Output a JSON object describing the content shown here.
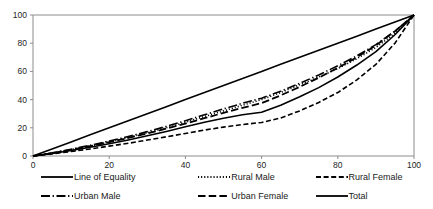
{
  "chart_data": {
    "type": "line",
    "title": "",
    "subtitle": "",
    "xlabel": "",
    "ylabel": "",
    "xlim": [
      0,
      100
    ],
    "ylim": [
      0,
      100
    ],
    "grid": false,
    "legend_position": "bottom",
    "xticks": [
      "0",
      "20",
      "40",
      "60",
      "80",
      "100"
    ],
    "yticks": [
      "0",
      "20",
      "40",
      "60",
      "80",
      "100"
    ],
    "xtick_values": [
      0,
      20,
      40,
      60,
      80,
      100
    ],
    "ytick_values": [
      0,
      20,
      40,
      60,
      80,
      100
    ],
    "x": [
      0,
      5,
      10,
      15,
      20,
      25,
      30,
      35,
      40,
      45,
      50,
      55,
      60,
      65,
      70,
      75,
      80,
      85,
      90,
      95,
      100
    ],
    "series": [
      {
        "name": "Line of Equality",
        "style": "solid",
        "color": "#000000",
        "width": 1.6,
        "values": [
          0,
          5,
          10,
          15,
          20,
          25,
          30,
          35,
          40,
          45,
          50,
          55,
          60,
          65,
          70,
          75,
          80,
          85,
          90,
          95,
          100
        ]
      },
      {
        "name": "Rural Male",
        "style": "dotted",
        "color": "#000000",
        "width": 1.6,
        "values": [
          0,
          2,
          4.5,
          7,
          10,
          13,
          16.5,
          20,
          24,
          28,
          32,
          36,
          40,
          45,
          50.5,
          56,
          62,
          69,
          77,
          87,
          100
        ]
      },
      {
        "name": "Rural Female",
        "style": "dashed",
        "color": "#000000",
        "width": 1.6,
        "values": [
          0,
          1.5,
          3.2,
          5,
          7,
          9,
          11.3,
          13.6,
          16,
          18.4,
          20.5,
          22.3,
          23.8,
          27,
          32,
          38,
          45,
          54,
          65,
          80,
          100
        ]
      },
      {
        "name": "Urban Male",
        "style": "dashdot",
        "color": "#000000",
        "width": 1.6,
        "values": [
          0,
          2.2,
          4.8,
          7.6,
          10.6,
          13.8,
          17.3,
          21,
          25,
          29.2,
          33.4,
          37.4,
          41,
          46,
          51.5,
          57.5,
          64,
          71,
          79,
          88.5,
          100
        ]
      },
      {
        "name": "Urban Female",
        "style": "longdash",
        "color": "#000000",
        "width": 1.8,
        "values": [
          0,
          2,
          4.4,
          7,
          9.8,
          12.8,
          16,
          19.4,
          23,
          26.8,
          30.6,
          34.2,
          37.5,
          43,
          49,
          55.5,
          62.5,
          70,
          78.5,
          88.5,
          100
        ]
      },
      {
        "name": "Total",
        "style": "solid",
        "color": "#000000",
        "width": 1.6,
        "values": [
          0,
          1.8,
          3.9,
          6.2,
          8.7,
          11.4,
          14.3,
          17.4,
          20.7,
          24,
          26.8,
          29.2,
          31,
          36,
          42,
          48.5,
          56,
          64.5,
          74,
          86,
          100
        ]
      }
    ]
  },
  "legend": {
    "rows": [
      [
        {
          "label": "Line of Equality",
          "style": "solid"
        },
        {
          "label": "Rural Male",
          "style": "dotted"
        },
        {
          "label": "Rural Female",
          "style": "dashed"
        }
      ],
      [
        {
          "label": "Urban Male",
          "style": "dashdot"
        },
        {
          "label": "Urban Female",
          "style": "longdash"
        },
        {
          "label": "Total",
          "style": "solid"
        }
      ]
    ]
  },
  "axis": {
    "color": "#8c8c8c",
    "tick_color": "#8c8c8c"
  }
}
